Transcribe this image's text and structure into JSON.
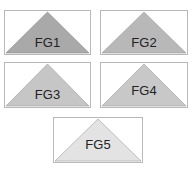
{
  "panels": [
    {
      "label": "FG1",
      "fill": "#a9a9a9"
    },
    {
      "label": "FG2",
      "fill": "#b8b8b8"
    },
    {
      "label": "FG3",
      "fill": "#c6c6c6"
    },
    {
      "label": "FG4",
      "fill": "#c8c8c8"
    },
    {
      "label": "FG5",
      "fill": "#e3e3e3"
    }
  ]
}
